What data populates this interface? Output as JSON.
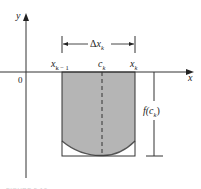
{
  "figure": {
    "type": "riemann-rectangle-below-axis",
    "colors": {
      "axis": "#333333",
      "region_fill": "#b5b5b5",
      "curve": "#555555",
      "rectangle_outline": "#333333",
      "dashed_line": "#333333",
      "background": "#ffffff"
    },
    "axes": {
      "x_label": "x",
      "y_label": "y",
      "origin_label": "0"
    },
    "interval": {
      "width_label_delta": "Δ",
      "width_label_var": "x",
      "width_label_sub": "k",
      "left_label_var": "x",
      "left_label_sub": "k − 1",
      "mid_label_var": "c",
      "mid_label_sub": "k",
      "right_label_var": "x",
      "right_label_sub": "k"
    },
    "height_measure": {
      "label_prefix": "f(",
      "label_var": "c",
      "label_sub": "k",
      "label_suffix": ")"
    },
    "caption": "FIGURE 5.10"
  }
}
